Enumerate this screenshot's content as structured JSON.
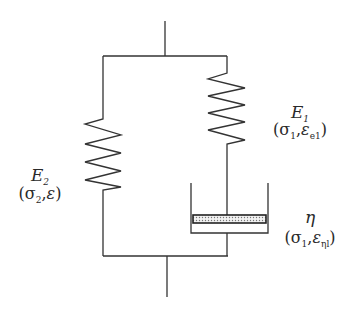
{
  "diagram": {
    "type": "rheological-model",
    "line_color": "#333333",
    "elements": {
      "spring_left": {
        "symbol": "E",
        "subscript": "2",
        "stress": "σ",
        "stress_sub": "2",
        "strain": "ε",
        "strain_sub": ""
      },
      "spring_right": {
        "symbol": "E",
        "subscript": "1",
        "stress": "σ",
        "stress_sub": "1",
        "strain": "ε",
        "strain_sub": "e1"
      },
      "dashpot": {
        "symbol": "η",
        "subscript": "",
        "stress": "σ",
        "stress_sub": "1",
        "strain": "ε",
        "strain_sub": "ηl"
      }
    },
    "punct": {
      "open": "(",
      "comma": ",",
      "close": ")"
    }
  }
}
